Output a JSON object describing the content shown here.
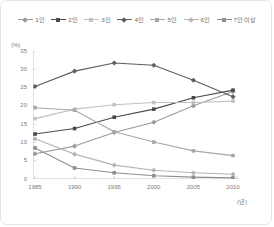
{
  "legend": {
    "position": "top-center",
    "entries": [
      {
        "label": "1인",
        "color": "#9a9a9a",
        "marker": "diamond"
      },
      {
        "label": "2인",
        "color": "#4a4a4a",
        "marker": "square"
      },
      {
        "label": "3인",
        "color": "#c2c2c2",
        "marker": "square"
      },
      {
        "label": "4인",
        "color": "#5e5e5e",
        "marker": "diamond"
      },
      {
        "label": "5인",
        "color": "#a8a8a8",
        "marker": "square"
      },
      {
        "label": "6인",
        "color": "#b5b5b5",
        "marker": "diamond"
      },
      {
        "label": "7인 이상",
        "color": "#8f8f8f",
        "marker": "square"
      }
    ]
  },
  "axes": {
    "y_unit_label": "(%)",
    "x_unit_label": "(년)",
    "y_ticks": [
      "0",
      "5",
      "10",
      "15",
      "20",
      "25",
      "30",
      "35"
    ],
    "x_ticks": [
      "1985",
      "1990",
      "1995",
      "2000",
      "2005",
      "2010"
    ]
  },
  "chart_data": {
    "type": "line",
    "title": "",
    "xlabel": "(년)",
    "ylabel": "(%)",
    "xlim": [
      1985,
      2010
    ],
    "ylim": [
      0,
      35
    ],
    "grid": false,
    "legend_position": "top-center",
    "categories": [
      "1985",
      "1990",
      "1995",
      "2000",
      "2005",
      "2010"
    ],
    "x": [
      1985,
      1990,
      1995,
      2000,
      2005,
      2010
    ],
    "series": [
      {
        "name": "1인",
        "color": "#9a9a9a",
        "marker": "diamond",
        "values": [
          6.9,
          9.0,
          12.7,
          15.5,
          20.0,
          23.9
        ]
      },
      {
        "name": "2인",
        "color": "#4a4a4a",
        "marker": "square",
        "values": [
          12.3,
          13.8,
          16.9,
          19.1,
          22.2,
          24.3
        ]
      },
      {
        "name": "3인",
        "color": "#c2c2c2",
        "marker": "square",
        "values": [
          16.5,
          19.1,
          20.3,
          20.9,
          20.9,
          21.3
        ]
      },
      {
        "name": "4인",
        "color": "#5e5e5e",
        "marker": "diamond",
        "values": [
          25.3,
          29.5,
          31.7,
          31.1,
          27.0,
          22.5
        ]
      },
      {
        "name": "5인",
        "color": "#a8a8a8",
        "marker": "square",
        "values": [
          19.5,
          18.8,
          12.9,
          10.1,
          7.7,
          6.4
        ]
      },
      {
        "name": "6인",
        "color": "#b5b5b5",
        "marker": "diamond",
        "values": [
          11.0,
          6.8,
          3.8,
          2.4,
          1.7,
          1.3
        ]
      },
      {
        "name": "7인 이상",
        "color": "#8f8f8f",
        "marker": "square",
        "values": [
          8.5,
          3.0,
          1.7,
          0.9,
          0.5,
          0.3
        ]
      }
    ]
  }
}
